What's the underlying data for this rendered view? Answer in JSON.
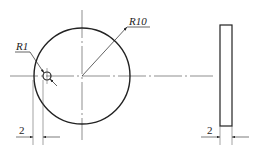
{
  "drawing": {
    "type": "engineering-drawing",
    "front_view": {
      "outer_circle": {
        "cx": 82,
        "cy": 76,
        "r": 48
      },
      "hole": {
        "cx": 47,
        "cy": 76,
        "r": 4
      }
    },
    "side_view": {
      "x": 220,
      "y": 25,
      "width": 12,
      "height": 101
    }
  },
  "labels": {
    "outer_radius": "R10",
    "hole_radius": "R1",
    "hole_offset": "2",
    "thickness": "2"
  },
  "colors": {
    "line": "#222222",
    "center_line": "#444444"
  }
}
